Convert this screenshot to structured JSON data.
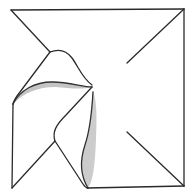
{
  "diagram": {
    "type": "origami-fold-illustration",
    "colors": {
      "line": "#2a2a2a",
      "shading": "#444444",
      "background": "#ffffff"
    },
    "elements": [
      "square-outline",
      "top-left-diagonal-crease",
      "top-right-diagonal-crease",
      "bottom-right-diagonal-crease",
      "upper-curled-flap",
      "lower-folded-flap",
      "stippled-shading-upper",
      "stippled-shading-lower"
    ]
  }
}
